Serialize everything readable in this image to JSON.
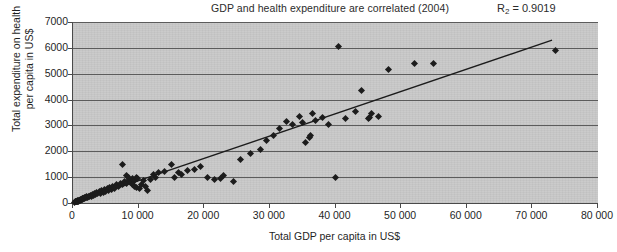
{
  "chart_data": {
    "type": "scatter",
    "title": "GDP and health expenditure are correlated (2004)",
    "xlabel": "Total GDP per capita in US$",
    "ylabel": "Total expenditure on health per capita in US$",
    "ylabel_line1": "Total expenditure on health",
    "ylabel_line2": "per capita in US$",
    "r2_prefix": "R",
    "r2_sub": "2",
    "r2_value": " = 0.9019",
    "r2_text": "R2 = 0.9019",
    "xlim": [
      0,
      80000
    ],
    "ylim": [
      0,
      7000
    ],
    "xticks": [
      0,
      10000,
      20000,
      30000,
      40000,
      50000,
      60000,
      70000,
      80000
    ],
    "xtick_labels": [
      "0",
      "10 000",
      "20 000",
      "30 000",
      "40 000",
      "50 000",
      "60 000",
      "70 000",
      "80 000"
    ],
    "yticks": [
      0,
      1000,
      2000,
      3000,
      4000,
      5000,
      6000,
      7000
    ],
    "ytick_labels": [
      "0",
      "1000",
      "2000",
      "3000",
      "4000",
      "5000",
      "6000",
      "7000"
    ],
    "grid": "horizontal",
    "legend": "none",
    "marker_color": "#1c1c1c",
    "plot_bg_color": "#c9c9c9",
    "gridline_color": "#5c5c5c",
    "trendline": {
      "color": "#1c1c1c",
      "x_start": 700,
      "y_start": 60,
      "x_end": 73000,
      "y_end": 6300
    },
    "points": [
      [
        200,
        30
      ],
      [
        350,
        40
      ],
      [
        420,
        55
      ],
      [
        500,
        45
      ],
      [
        560,
        70
      ],
      [
        620,
        60
      ],
      [
        700,
        80
      ],
      [
        760,
        55
      ],
      [
        820,
        95
      ],
      [
        880,
        70
      ],
      [
        950,
        110
      ],
      [
        1020,
        85
      ],
      [
        1080,
        130
      ],
      [
        1150,
        100
      ],
      [
        1220,
        150
      ],
      [
        1300,
        120
      ],
      [
        1380,
        170
      ],
      [
        1450,
        140
      ],
      [
        1520,
        190
      ],
      [
        1600,
        160
      ],
      [
        1700,
        210
      ],
      [
        1800,
        180
      ],
      [
        1900,
        230
      ],
      [
        2000,
        200
      ],
      [
        2100,
        250
      ],
      [
        2200,
        220
      ],
      [
        2350,
        270
      ],
      [
        2500,
        240
      ],
      [
        2650,
        300
      ],
      [
        2800,
        260
      ],
      [
        2950,
        330
      ],
      [
        3100,
        290
      ],
      [
        3250,
        360
      ],
      [
        3400,
        320
      ],
      [
        3600,
        400
      ],
      [
        3800,
        350
      ],
      [
        4000,
        430
      ],
      [
        4200,
        380
      ],
      [
        4400,
        470
      ],
      [
        4600,
        420
      ],
      [
        4800,
        510
      ],
      [
        5000,
        460
      ],
      [
        5200,
        550
      ],
      [
        5400,
        500
      ],
      [
        5600,
        590
      ],
      [
        5800,
        540
      ],
      [
        6000,
        630
      ],
      [
        6300,
        580
      ],
      [
        6600,
        700
      ],
      [
        6900,
        640
      ],
      [
        7200,
        760
      ],
      [
        7500,
        700
      ],
      [
        7800,
        820
      ],
      [
        8100,
        750
      ],
      [
        8400,
        880
      ],
      [
        8700,
        810
      ],
      [
        9000,
        940
      ],
      [
        9300,
        870
      ],
      [
        9600,
        1000
      ],
      [
        9900,
        930
      ],
      [
        7500,
        1500
      ],
      [
        8200,
        1060
      ],
      [
        8500,
        980
      ],
      [
        9000,
        700
      ],
      [
        9400,
        640
      ],
      [
        9700,
        600
      ],
      [
        10100,
        560
      ],
      [
        10400,
        720
      ],
      [
        10700,
        880
      ],
      [
        11000,
        650
      ],
      [
        11400,
        500
      ],
      [
        11800,
        900
      ],
      [
        12200,
        1100
      ],
      [
        12600,
        1000
      ],
      [
        13000,
        1180
      ],
      [
        14000,
        1220
      ],
      [
        15000,
        1500
      ],
      [
        15400,
        1000
      ],
      [
        16000,
        1180
      ],
      [
        16500,
        1100
      ],
      [
        17500,
        1250
      ],
      [
        18500,
        1300
      ],
      [
        19500,
        1420
      ],
      [
        20500,
        1000
      ],
      [
        21500,
        900
      ],
      [
        22500,
        950
      ],
      [
        23000,
        1050
      ],
      [
        24500,
        850
      ],
      [
        25500,
        1700
      ],
      [
        27000,
        1900
      ],
      [
        28500,
        2050
      ],
      [
        29500,
        2400
      ],
      [
        30500,
        2600
      ],
      [
        31500,
        2900
      ],
      [
        32500,
        3150
      ],
      [
        33500,
        3050
      ],
      [
        34500,
        3350
      ],
      [
        35000,
        3100
      ],
      [
        35500,
        2350
      ],
      [
        36000,
        2550
      ],
      [
        36200,
        2600
      ],
      [
        36500,
        3450
      ],
      [
        37000,
        3200
      ],
      [
        38000,
        3300
      ],
      [
        39000,
        3050
      ],
      [
        40000,
        1000
      ],
      [
        40500,
        6050
      ],
      [
        41500,
        3250
      ],
      [
        43000,
        3550
      ],
      [
        44000,
        4350
      ],
      [
        45000,
        3250
      ],
      [
        45200,
        3300
      ],
      [
        45500,
        3450
      ],
      [
        46500,
        3350
      ],
      [
        48000,
        5150
      ],
      [
        52000,
        5400
      ],
      [
        55000,
        5400
      ],
      [
        73500,
        5900
      ]
    ]
  }
}
